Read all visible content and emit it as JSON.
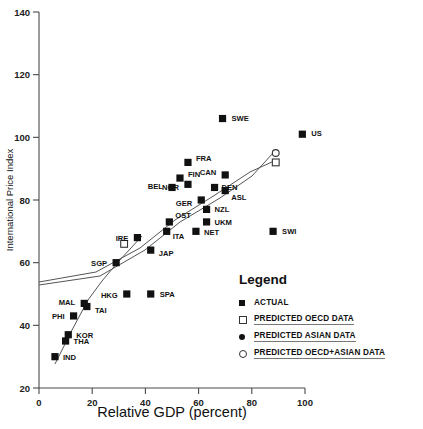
{
  "chart_data": {
    "type": "scatter",
    "title": "",
    "xlabel": "Relative GDP (percent)",
    "ylabel": "International Price Index",
    "xlim": [
      0,
      100
    ],
    "ylim": [
      20,
      140
    ],
    "xticks": [
      "0",
      "20",
      "40",
      "60",
      "80",
      "100"
    ],
    "yticks": [
      "20",
      "40",
      "60",
      "80",
      "100",
      "120",
      "140"
    ],
    "grid": false,
    "legend_position": "inside-bottom-right",
    "series": [
      {
        "name": "ACTUAL",
        "marker": "filled-square",
        "points": [
          {
            "label": "IND",
            "x": 6,
            "y": 30
          },
          {
            "label": "THA",
            "x": 10,
            "y": 35
          },
          {
            "label": "KOR",
            "x": 11,
            "y": 37
          },
          {
            "label": "PHI",
            "x": 13,
            "y": 43
          },
          {
            "label": "MAL",
            "x": 17,
            "y": 47
          },
          {
            "label": "TAI",
            "x": 18,
            "y": 46
          },
          {
            "label": "SGP",
            "x": 29,
            "y": 60
          },
          {
            "label": "HKG",
            "x": 33,
            "y": 50
          },
          {
            "label": "SPA",
            "x": 42,
            "y": 50
          },
          {
            "label": "JAP",
            "x": 42,
            "y": 64
          },
          {
            "label": "IRE",
            "x": 37,
            "y": 68
          },
          {
            "label": "ITA",
            "x": 48,
            "y": 70
          },
          {
            "label": "OST",
            "x": 49,
            "y": 73
          },
          {
            "label": "NET",
            "x": 59,
            "y": 70
          },
          {
            "label": "UKM",
            "x": 63,
            "y": 73
          },
          {
            "label": "NZL",
            "x": 63,
            "y": 77
          },
          {
            "label": "BEL",
            "x": 50,
            "y": 84
          },
          {
            "label": "FIN",
            "x": 53,
            "y": 87
          },
          {
            "label": "NOR",
            "x": 56,
            "y": 85
          },
          {
            "label": "GER",
            "x": 61,
            "y": 80
          },
          {
            "label": "DEN",
            "x": 66,
            "y": 84
          },
          {
            "label": "ASL",
            "x": 70,
            "y": 83
          },
          {
            "label": "FRA",
            "x": 56,
            "y": 92
          },
          {
            "label": "CAN",
            "x": 70,
            "y": 88
          },
          {
            "label": "SWE",
            "x": 69,
            "y": 106
          },
          {
            "label": "SWI",
            "x": 88,
            "y": 70
          },
          {
            "label": "US",
            "x": 99,
            "y": 101
          }
        ]
      },
      {
        "name": "PREDICTED OECD DATA",
        "marker": "open-square",
        "points": [
          {
            "label": "",
            "x": 32,
            "y": 66
          },
          {
            "label": "",
            "x": 89,
            "y": 92
          }
        ]
      },
      {
        "name": "PREDICTED ASIAN DATA",
        "marker": "filled-circle",
        "points": []
      },
      {
        "name": "PREDICTED OECD+ASIAN DATA",
        "marker": "open-circle",
        "points": [
          {
            "label": "",
            "x": 89,
            "y": 95
          }
        ]
      }
    ],
    "annotations": [
      "Upper fit line runs from lower-left cluster through OECD cluster to open square / open circle at right",
      "Asian fit curve runs from IND upward through TAI, HKG toward JAP"
    ]
  },
  "legend": {
    "title": "Legend",
    "items": [
      {
        "symbol": "filled-square-icon",
        "label": "ACTUAL",
        "underline": false
      },
      {
        "symbol": "open-square-icon",
        "label": "PREDICTED OECD DATA",
        "underline": true
      },
      {
        "symbol": "filled-circle-icon",
        "label": "PREDICTED ASIAN DATA",
        "underline": true
      },
      {
        "symbol": "open-circle-icon",
        "label": "PREDICTED OECD+ASIAN DATA",
        "underline": true
      }
    ]
  }
}
